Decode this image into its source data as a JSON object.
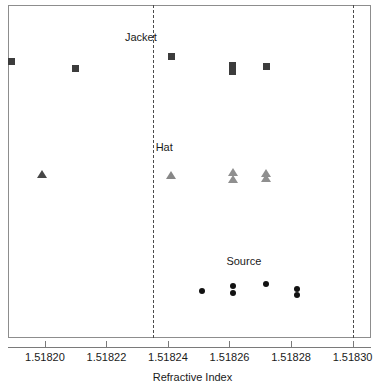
{
  "chart_data": {
    "type": "scatter",
    "title": "",
    "xlabel": "Refractive Index",
    "ylabel": "",
    "xlim": [
      1.518188,
      1.518306
    ],
    "grid": false,
    "legend_position": "inline-labels",
    "xticks": [
      1.5182,
      1.51822,
      1.51824,
      1.51826,
      1.51828,
      1.5183
    ],
    "xtick_labels": [
      "1.51820",
      "1.51822",
      "1.51824",
      "1.51826",
      "1.51828",
      "1.51830"
    ],
    "reference_lines": [
      {
        "name": "lower-reference-line",
        "x": 1.518235,
        "style": "dashed"
      },
      {
        "name": "upper-reference-line",
        "x": 1.5183,
        "style": "dashed"
      }
    ],
    "series": [
      {
        "name": "Jacket",
        "marker": "square",
        "label": "Jacket",
        "label_x": 1.518226,
        "label_y": 0.905,
        "points": [
          {
            "x": 1.518189,
            "y": 0.83,
            "color": "#3c3c3c"
          },
          {
            "x": 1.51821,
            "y": 0.808,
            "color": "#3c3c3c"
          },
          {
            "x": 1.518241,
            "y": 0.844,
            "color": "#3c3c3c"
          },
          {
            "x": 1.518261,
            "y": 0.817,
            "color": "#3c3c3c"
          },
          {
            "x": 1.518261,
            "y": 0.799,
            "color": "#3c3c3c"
          },
          {
            "x": 1.518272,
            "y": 0.814,
            "color": "#3c3c3c"
          }
        ]
      },
      {
        "name": "Hat",
        "marker": "triangle",
        "label": "Hat",
        "label_x": 1.518236,
        "label_y": 0.573,
        "points": [
          {
            "x": 1.518199,
            "y": 0.492,
            "color": "#474747"
          },
          {
            "x": 1.518241,
            "y": 0.489,
            "color": "#878787"
          },
          {
            "x": 1.518261,
            "y": 0.497,
            "color": "#8f8f8f"
          },
          {
            "x": 1.518261,
            "y": 0.476,
            "color": "#8f8f8f"
          },
          {
            "x": 1.518272,
            "y": 0.496,
            "color": "#8f8f8f"
          },
          {
            "x": 1.518272,
            "y": 0.479,
            "color": "#8f8f8f"
          }
        ]
      },
      {
        "name": "Source",
        "marker": "circle",
        "label": "Source",
        "label_x": 1.518259,
        "label_y": 0.232,
        "points": [
          {
            "x": 1.518251,
            "y": 0.14,
            "color": "#121212"
          },
          {
            "x": 1.518261,
            "y": 0.155,
            "color": "#121212"
          },
          {
            "x": 1.518261,
            "y": 0.136,
            "color": "#121212"
          },
          {
            "x": 1.518272,
            "y": 0.161,
            "color": "#121212"
          },
          {
            "x": 1.518282,
            "y": 0.148,
            "color": "#121212"
          },
          {
            "x": 1.518282,
            "y": 0.13,
            "color": "#121212"
          }
        ]
      }
    ]
  },
  "axis": {
    "x_title": "Refractive Index"
  }
}
